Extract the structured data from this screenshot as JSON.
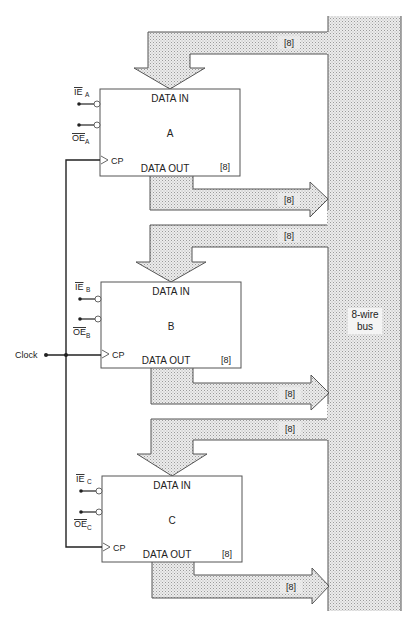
{
  "diagram": {
    "bus": {
      "label_line1": "8-wire",
      "label_line2": "bus",
      "fill_color": "#d9d9d9",
      "stroke_color": "#555555"
    },
    "clock": {
      "label": "Clock"
    },
    "width_label": "[8]",
    "registers": [
      {
        "name": "A",
        "data_in": "DATA IN",
        "data_out": "DATA OUT",
        "width": "[8]",
        "cp": "CP",
        "ie": "IE",
        "ie_sub": "A",
        "oe": "OE",
        "oe_sub": "A",
        "in_bus_label": "[8]",
        "out_bus_label": "[8]"
      },
      {
        "name": "B",
        "data_in": "DATA IN",
        "data_out": "DATA OUT",
        "width": "[8]",
        "cp": "CP",
        "ie": "IE",
        "ie_sub": "B",
        "oe": "OE",
        "oe_sub": "B",
        "in_bus_label": "[8]",
        "out_bus_label": "[8]"
      },
      {
        "name": "C",
        "data_in": "DATA IN",
        "data_out": "DATA OUT",
        "width": "[8]",
        "cp": "CP",
        "ie": "IE",
        "ie_sub": "C",
        "oe": "OE",
        "oe_sub": "C",
        "in_bus_label": "[8]",
        "out_bus_label": "[8]"
      }
    ]
  }
}
